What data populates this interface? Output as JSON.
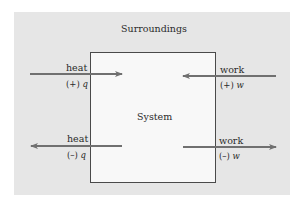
{
  "diagram": {
    "surroundings_label": "Surroundings",
    "system_label": "System",
    "colors": {
      "panel": "#e6e6e6",
      "system_box": "#f8f8f8",
      "border": "#4a4a4a",
      "arrow": "#707070",
      "text": "#2a2a2a"
    },
    "flows": [
      {
        "id": "heat-in",
        "label": "heat",
        "sign": "(+)",
        "symbol": "q",
        "direction": "into-system"
      },
      {
        "id": "work-in",
        "label": "work",
        "sign": "(+)",
        "symbol": "w",
        "direction": "into-system"
      },
      {
        "id": "heat-out",
        "label": "heat",
        "sign": "(–)",
        "symbol": "q",
        "direction": "out-of-system"
      },
      {
        "id": "work-out",
        "label": "work",
        "sign": "(–)",
        "symbol": "w",
        "direction": "out-of-system"
      }
    ]
  }
}
